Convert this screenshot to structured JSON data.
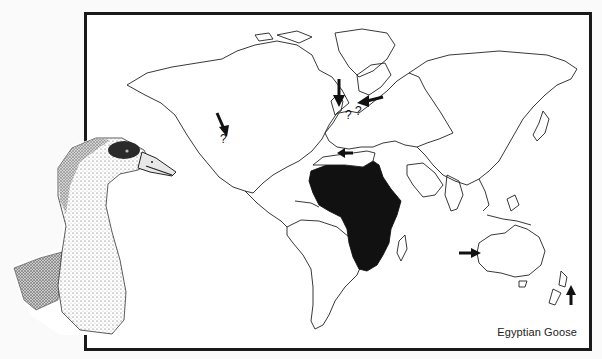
{
  "figure": {
    "caption": "Egyptian Goose",
    "species": "Egyptian Goose",
    "map_type": "world distribution map",
    "native_range_region": "Africa (south of the Sahara, plus Nile valley)",
    "native_range_fill": "#111111",
    "outline_color": "#222222",
    "frame_color": "#1a1a1a"
  },
  "markers": [
    {
      "id": "north-america",
      "type": "arrow-with-question",
      "label": "?",
      "direction": "down"
    },
    {
      "id": "britain",
      "type": "arrow",
      "label": "",
      "direction": "down"
    },
    {
      "id": "central-europe",
      "type": "arrow-with-question",
      "label": "?",
      "direction": "left"
    },
    {
      "id": "western-europe",
      "type": "question",
      "label": "?"
    },
    {
      "id": "north-africa",
      "type": "arrow",
      "label": "",
      "direction": "left"
    },
    {
      "id": "western-australia",
      "type": "arrow",
      "label": "",
      "direction": "right"
    },
    {
      "id": "new-zealand",
      "type": "arrow",
      "label": "",
      "direction": "up"
    }
  ],
  "illustration": {
    "subject": "Egyptian Goose head and neck",
    "style": "pen-and-ink stipple drawing"
  }
}
